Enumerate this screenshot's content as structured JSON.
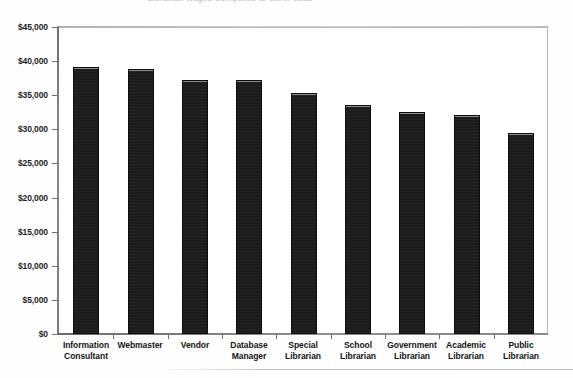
{
  "chart_data": {
    "type": "bar",
    "title": "Librarian Wages Compared to Other Jobs",
    "xlabel": "",
    "ylabel": "",
    "ylim": [
      0,
      45000
    ],
    "grid": false,
    "legend": "none",
    "tick_format": "$#,##0",
    "categories": [
      "Information Consultant",
      "Webmaster",
      "Vendor",
      "Database Manager",
      "Special Librarian",
      "School Librarian",
      "Government Librarian",
      "Academic Librarian",
      "Public Librarian"
    ],
    "values": [
      39200,
      38800,
      37300,
      37200,
      35300,
      33600,
      32600,
      32100,
      29400
    ],
    "ytick_labels": [
      "$45,000",
      "$40,000",
      "$35,000",
      "$30,000",
      "$25,000",
      "$20,000",
      "$15,000",
      "$10,000",
      "$5,000",
      "$0"
    ],
    "ytick_values": [
      45000,
      40000,
      35000,
      30000,
      25000,
      20000,
      15000,
      10000,
      5000,
      0
    ],
    "bar_color": "#1b1b1b",
    "axis_color": "#6f6f6f",
    "background_color": "#ffffff"
  },
  "category_lines": [
    [
      "Information",
      "Consultant"
    ],
    [
      "Webmaster"
    ],
    [
      "Vendor"
    ],
    [
      "Database",
      "Manager"
    ],
    [
      "Special",
      "Librarian"
    ],
    [
      "School",
      "Librarian"
    ],
    [
      "Government",
      "Librarian"
    ],
    [
      "Academic",
      "Librarian"
    ],
    [
      "Public",
      "Librarian"
    ]
  ]
}
